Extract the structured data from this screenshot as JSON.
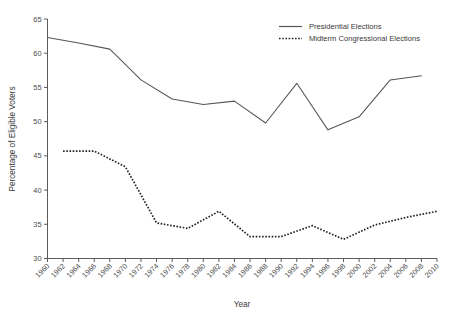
{
  "chart_data": {
    "type": "line",
    "title": "",
    "xlabel": "Year",
    "ylabel": "Percentage of Eligible Voters",
    "xlim": [
      1960,
      2010
    ],
    "ylim": [
      30,
      65
    ],
    "grid": false,
    "legend_position": "top-right",
    "xticks": [
      1960,
      1962,
      1964,
      1966,
      1968,
      1970,
      1972,
      1974,
      1976,
      1978,
      1980,
      1982,
      1984,
      1986,
      1988,
      1990,
      1992,
      1994,
      1996,
      1998,
      2000,
      2002,
      2004,
      2006,
      2008,
      2010
    ],
    "yticks": [
      30,
      35,
      40,
      45,
      50,
      55,
      60,
      65
    ],
    "series": [
      {
        "name": "Presidential Elections",
        "style": "solid",
        "color": "#555555",
        "x": [
          1960,
          1964,
          1968,
          1972,
          1976,
          1980,
          1984,
          1988,
          1992,
          1996,
          2000,
          2004,
          2008
        ],
        "values": [
          62.3,
          61.5,
          60.6,
          56.1,
          53.3,
          52.5,
          53.0,
          49.8,
          55.6,
          48.8,
          50.7,
          56.1,
          56.7
        ]
      },
      {
        "name": "Midterm Congressional Elections",
        "style": "dotted",
        "color": "#232323",
        "x": [
          1962,
          1966,
          1970,
          1974,
          1978,
          1982,
          1986,
          1990,
          1994,
          1998,
          2002,
          2006,
          2010
        ],
        "values": [
          45.7,
          45.7,
          43.4,
          35.2,
          34.4,
          36.9,
          33.2,
          33.2,
          34.8,
          32.8,
          34.9,
          36.0,
          36.9
        ]
      }
    ]
  },
  "legend": {
    "entries": [
      {
        "label": "Presidential Elections"
      },
      {
        "label": "Midterm Congressional Elections"
      }
    ]
  },
  "axes": {
    "x_title": "Year",
    "y_title": "Percentage of Eligible Voters"
  }
}
